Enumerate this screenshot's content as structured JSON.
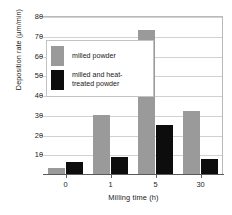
{
  "chart_data": {
    "type": "bar",
    "title": "",
    "xlabel": "Milling time (h)",
    "ylabel": "Deposition rate (µm/min)",
    "categories": [
      "0",
      "1",
      "5",
      "30"
    ],
    "series": [
      {
        "name": "milled powder",
        "color": "#9a9a9a",
        "values": [
          3,
          30,
          73,
          32
        ]
      },
      {
        "name": "milled and heat-treated powder",
        "color": "#0d0d0d",
        "values": [
          6,
          8.5,
          25,
          7.5
        ]
      }
    ],
    "ylim": [
      0,
      80
    ],
    "yticks": [
      10,
      20,
      30,
      40,
      50,
      60,
      70,
      80
    ],
    "ytick_labels": [
      "10",
      "20",
      "30",
      "40",
      "50",
      "60",
      "70",
      "80"
    ],
    "grid": true,
    "legend_position": "upper-left-inside"
  },
  "legend": {
    "entries": [
      {
        "label": "milled powder",
        "swatch": "gray-swatch"
      },
      {
        "label": "milled and heat-\ntreated powder",
        "swatch": "black-swatch"
      }
    ]
  }
}
